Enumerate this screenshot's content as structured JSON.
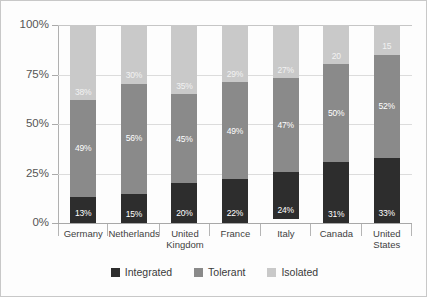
{
  "chart_data": {
    "type": "bar",
    "subtype": "stacked-100-percent",
    "title": "",
    "subtitle": "",
    "xlabel": "",
    "ylabel": "",
    "ylim": [
      0,
      100
    ],
    "ytick_labels": [
      "0%",
      "25%",
      "50%",
      "75%",
      "100%"
    ],
    "ytick_values": [
      0,
      25,
      50,
      75,
      100
    ],
    "grid": true,
    "legend_position": "bottom-center",
    "categories": [
      "Germany",
      "Netherlands",
      "United Kingdom",
      "France",
      "Italy",
      "Canada",
      "United States"
    ],
    "series": [
      {
        "name": "Integrated",
        "color": "#2d2d2d",
        "values": [
          13,
          15,
          20,
          22,
          24,
          31,
          33
        ],
        "labels": [
          "13%",
          "15%",
          "20%",
          "22%",
          "24%",
          "31%",
          "33%"
        ]
      },
      {
        "name": "Tolerant",
        "color": "#8a8a8a",
        "values": [
          49,
          56,
          45,
          49,
          47,
          50,
          52
        ],
        "labels": [
          "49%",
          "56%",
          "45%",
          "49%",
          "47%",
          "50%",
          "52%"
        ]
      },
      {
        "name": "Isolated",
        "color": "#c9c9c9",
        "values": [
          38,
          30,
          35,
          29,
          27,
          20,
          15
        ],
        "labels": [
          "38%",
          "30%",
          "35%",
          "29%",
          "27%",
          "20",
          "15"
        ]
      }
    ]
  },
  "axis": {
    "y_labels": [
      {
        "text": "100%",
        "value": 100
      },
      {
        "text": "75%",
        "value": 75
      },
      {
        "text": "50%",
        "value": 50
      },
      {
        "text": "25%",
        "value": 25
      },
      {
        "text": "0%",
        "value": 0
      }
    ]
  },
  "categories_display": [
    {
      "line1": "Germany",
      "line2": ""
    },
    {
      "line1": "Netherlands",
      "line2": ""
    },
    {
      "line1": "United",
      "line2": "Kingdom"
    },
    {
      "line1": "France",
      "line2": ""
    },
    {
      "line1": "Italy",
      "line2": ""
    },
    {
      "line1": "Canada",
      "line2": ""
    },
    {
      "line1": "United",
      "line2": "States"
    }
  ],
  "legend": {
    "items": [
      {
        "label": "Integrated",
        "color": "#2d2d2d"
      },
      {
        "label": "Tolerant",
        "color": "#8a8a8a"
      },
      {
        "label": "Isolated",
        "color": "#c9c9c9"
      }
    ]
  },
  "colors": {
    "integrated": "#2d2d2d",
    "tolerant": "#8a8a8a",
    "isolated": "#c9c9c9",
    "grid": "#dcdcdc",
    "axis": "#a8a8a8",
    "frame": "#c8c8c8",
    "background": "#fdfdfd"
  }
}
